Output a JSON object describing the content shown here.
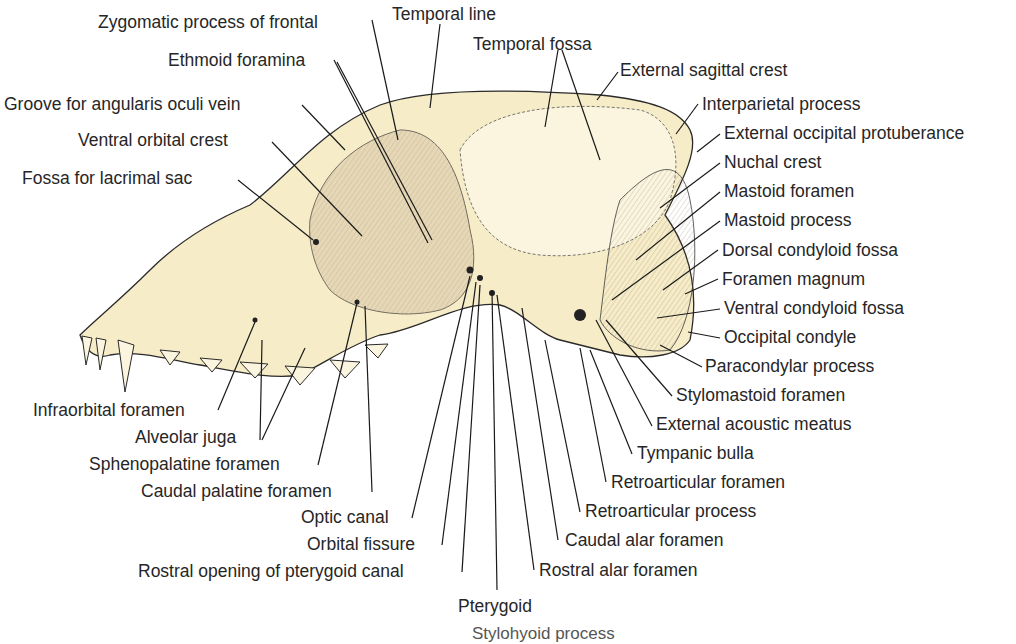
{
  "figure": {
    "colors": {
      "bone": "#f6ecc8",
      "bone_light": "#fbf5df",
      "shade": "#b9a88c",
      "line": "#222222",
      "background": "#ffffff"
    }
  },
  "labels": {
    "left_top": [
      {
        "text": "Zygomatic process of frontal",
        "x": 98,
        "y": 12
      },
      {
        "text": "Ethmoid foramina",
        "x": 168,
        "y": 50
      },
      {
        "text": "Groove for angularis oculi vein",
        "x": 4,
        "y": 94
      },
      {
        "text": "Ventral orbital crest",
        "x": 78,
        "y": 130
      },
      {
        "text": "Fossa for lacrimal sac",
        "x": 22,
        "y": 168
      }
    ],
    "top": [
      {
        "text": "Temporal line",
        "x": 392,
        "y": 4
      },
      {
        "text": "Temporal fossa",
        "x": 473,
        "y": 34
      },
      {
        "text": "External sagittal crest",
        "x": 620,
        "y": 60
      }
    ],
    "right": [
      {
        "text": "Interparietal process",
        "x": 702,
        "y": 94
      },
      {
        "text": "External occipital protuberance",
        "x": 724,
        "y": 123
      },
      {
        "text": "Nuchal crest",
        "x": 724,
        "y": 152
      },
      {
        "text": "Mastoid foramen",
        "x": 724,
        "y": 181
      },
      {
        "text": "Mastoid process",
        "x": 724,
        "y": 210
      },
      {
        "text": "Dorsal condyloid fossa",
        "x": 722,
        "y": 240
      },
      {
        "text": "Foramen magnum",
        "x": 722,
        "y": 269
      },
      {
        "text": "Ventral condyloid fossa",
        "x": 724,
        "y": 298
      },
      {
        "text": "Occipital condyle",
        "x": 724,
        "y": 327
      },
      {
        "text": "Paracondylar process",
        "x": 705,
        "y": 356
      },
      {
        "text": "Stylomastoid foramen",
        "x": 676,
        "y": 385
      }
    ],
    "bottom_right": [
      {
        "text": "External acoustic meatus",
        "x": 656,
        "y": 414
      },
      {
        "text": "Tympanic bulla",
        "x": 637,
        "y": 443
      },
      {
        "text": "Retroarticular foramen",
        "x": 611,
        "y": 472
      },
      {
        "text": "Retroarticular process",
        "x": 585,
        "y": 501
      },
      {
        "text": "Caudal alar foramen",
        "x": 565,
        "y": 530
      },
      {
        "text": "Rostral alar foramen",
        "x": 539,
        "y": 560
      }
    ],
    "bottom_left": [
      {
        "text": "Infraorbital foramen",
        "x": 33,
        "y": 400
      },
      {
        "text": "Alveolar juga",
        "x": 135,
        "y": 427
      },
      {
        "text": "Sphenopalatine foramen",
        "x": 89,
        "y": 454
      },
      {
        "text": "Caudal palatine foramen",
        "x": 141,
        "y": 481
      },
      {
        "text": "Optic canal",
        "x": 301,
        "y": 507
      },
      {
        "text": "Orbital fissure",
        "x": 307,
        "y": 534
      },
      {
        "text": "Rostral opening of pterygoid canal",
        "x": 138,
        "y": 561
      },
      {
        "text": "Pterygoid",
        "x": 458,
        "y": 596
      }
    ],
    "cut_off": {
      "text": "Stylohyoid process (partially visible)",
      "x": 472,
      "y": 624
    }
  }
}
